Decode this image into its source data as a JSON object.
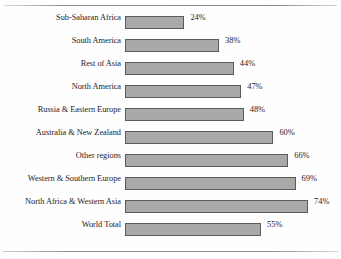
{
  "header": {
    "cropped_caption": ""
  },
  "chart_data": {
    "type": "bar",
    "orientation": "horizontal",
    "title": "",
    "xlabel": "",
    "ylabel": "",
    "xlim": [
      0,
      100
    ],
    "grid": false,
    "legend": null,
    "value_suffix": "%",
    "categories": [
      "Sub-Saharan Africa",
      "South America",
      "Rest of Asia",
      "North America",
      "Russia & Eastern Europe",
      "Australia & New Zealand",
      "Other regions",
      "Western & Southern Europe",
      "North Africa & Western Asia",
      "World Total"
    ],
    "values": [
      24,
      38,
      44,
      47,
      48,
      60,
      66,
      69,
      74,
      55
    ],
    "value_labels": [
      "24%",
      "38%",
      "44%",
      "47%",
      "48%",
      "60%",
      "66%",
      "69%",
      "74%",
      "55%"
    ],
    "bar_fill_color": "#a9a9a9",
    "bar_border_color": "#5b5b5b",
    "background_color": "#fefefe",
    "text_color": "#26211e"
  }
}
